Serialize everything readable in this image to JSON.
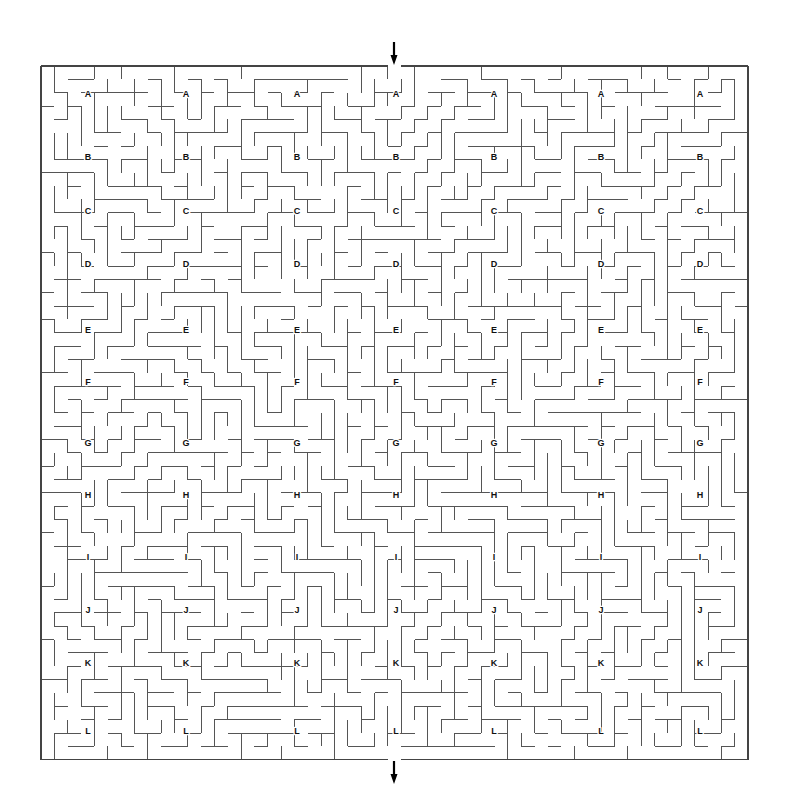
{
  "page": {
    "title": "Maze Puzzle",
    "background_color": "#ffffff",
    "width": 787,
    "height": 812
  },
  "maze": {
    "wall_color": "#555555",
    "border_color": "#444444",
    "label_color": "#111111",
    "cols": 53,
    "rows": 52,
    "cell_size": 13.34,
    "origin_x": 41,
    "origin_y": 66,
    "entrance_label": "entrance-arrow",
    "exit_label": "exit-arrow",
    "entrance_x": 394,
    "exit_x": 394,
    "entrance_col": 26,
    "exit_col": 26,
    "row_labels": [
      "A",
      "B",
      "C",
      "D",
      "E",
      "F",
      "G",
      "H",
      "I",
      "J",
      "K",
      "L"
    ],
    "column_labels": [
      "1",
      "2",
      "3",
      "4",
      "5",
      "6",
      "7"
    ],
    "label_columns_x": [
      88,
      186,
      297,
      396,
      494,
      601,
      700
    ],
    "label_rows_y": [
      95,
      158,
      212,
      265,
      331,
      383,
      444,
      496,
      558,
      611,
      664,
      732
    ],
    "seed": 20240517
  },
  "arrows": {
    "top": {
      "name": "entrance-arrow",
      "glyph": "↓",
      "x": 394,
      "y": 53
    },
    "bottom": {
      "name": "exit-arrow",
      "glyph": "↓",
      "x": 394,
      "y": 772
    }
  },
  "chart_data": {
    "type": "table",
    "categories": [
      "A",
      "B",
      "C",
      "D",
      "E",
      "F",
      "G",
      "H",
      "I",
      "J",
      "K",
      "L"
    ],
    "series": [
      {
        "name": "label_row_y_px",
        "values": [
          95,
          158,
          212,
          265,
          331,
          383,
          444,
          496,
          558,
          611,
          664,
          732
        ]
      }
    ],
    "xlabel": "Label column x (px)",
    "ylabel": "Label row y (px)",
    "x": [
      88,
      186,
      297,
      396,
      494,
      601,
      700
    ],
    "grid": false,
    "legend": "none"
  }
}
